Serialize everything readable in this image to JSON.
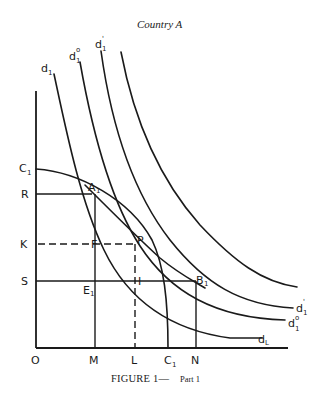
{
  "figure": {
    "title": "Country A",
    "caption_main": "FIGURE 1—",
    "caption_part": "Part 1"
  },
  "axes": {
    "origin": "O",
    "y_ticks": [
      {
        "label": "C",
        "sub": "1"
      },
      {
        "label": "R",
        "sub": ""
      },
      {
        "label": "K",
        "sub": ""
      },
      {
        "label": "S",
        "sub": ""
      }
    ],
    "x_ticks": [
      {
        "label": "M",
        "sub": ""
      },
      {
        "label": "L",
        "sub": ""
      },
      {
        "label": "C",
        "sub": "1"
      },
      {
        "label": "N",
        "sub": ""
      }
    ]
  },
  "points": {
    "A1": {
      "label": "A",
      "sub": "1"
    },
    "P": {
      "label": "P",
      "sub": ""
    },
    "B1": {
      "label": "B",
      "sub": "1"
    },
    "E1": {
      "label": "E",
      "sub": "1"
    },
    "F": {
      "label": "F",
      "sub": ""
    },
    "I": {
      "label": "I",
      "sub": ""
    }
  },
  "curves": {
    "top_labels": [
      {
        "label": "d",
        "sub": "1",
        "sup": ""
      },
      {
        "label": "d",
        "sub": "1",
        "sup": "o"
      },
      {
        "label": "d",
        "sub": "1",
        "sup": "'"
      }
    ],
    "end_labels": [
      {
        "label": "d",
        "sub": "1",
        "sup": "'"
      },
      {
        "label": "d",
        "sub": "1",
        "sup": "o"
      },
      {
        "label": "d",
        "sub": "L",
        "sup": ""
      }
    ],
    "production_frontier": "C1C1"
  }
}
